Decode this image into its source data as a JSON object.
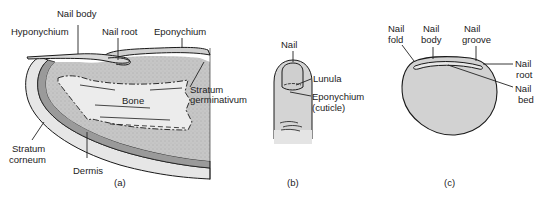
{
  "figure": {
    "panels": [
      {
        "id": "a",
        "caption": "(a)",
        "description": "Longitudinal section of fingertip and nail",
        "labels": {
          "hyponychium": "Hyponychium",
          "nail_body": "Nail body",
          "nail_root": "Nail root",
          "eponychium": "Eponychium",
          "bone": "Bone",
          "stratum_germinativum_1": "Stratum",
          "stratum_germinativum_2": "germinativum",
          "stratum_corneum_1": "Stratum",
          "stratum_corneum_2": "corneum",
          "dermis": "Dermis"
        }
      },
      {
        "id": "b",
        "caption": "(b)",
        "description": "Dorsal view of fingertip",
        "labels": {
          "nail": "Nail",
          "lunula": "Lunula",
          "eponychium_1": "Eponychium",
          "eponychium_2": "(cuticle)"
        }
      },
      {
        "id": "c",
        "caption": "(c)",
        "description": "Cross section of fingertip",
        "labels": {
          "nail_fold_1": "Nail",
          "nail_fold_2": "fold",
          "nail_body_1": "Nail",
          "nail_body_2": "body",
          "nail_groove_1": "Nail",
          "nail_groove_2": "groove",
          "nail_root_1": "Nail",
          "nail_root_2": "root",
          "nail_bed_1": "Nail",
          "nail_bed_2": "bed"
        }
      }
    ],
    "colors": {
      "tissue_fill": "#c9c9c9",
      "dermis_band": "#9a9a9a",
      "bone_fill": "#ececec",
      "outline": "#1a1a1a"
    }
  }
}
